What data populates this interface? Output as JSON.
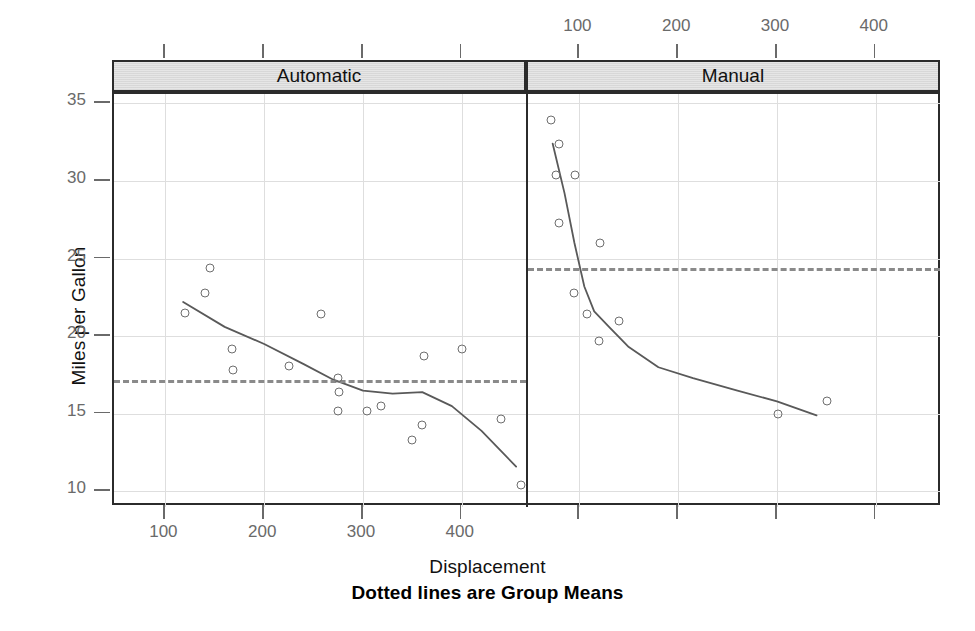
{
  "chart_data": {
    "type": "scatter",
    "title": "",
    "xlabel": "Displacement",
    "ylabel": "Miles per Gallon",
    "caption": "Dotted lines are Group Means",
    "xlim": [
      48,
      465
    ],
    "ylim": [
      9.0,
      35.6
    ],
    "xticks": [
      100,
      200,
      300,
      400
    ],
    "yticks": [
      10,
      15,
      20,
      25,
      30,
      35
    ],
    "grid": true,
    "legend": "none",
    "panel_variable": "Transmission",
    "panels": [
      {
        "label": "Automatic",
        "axis_position": "bottom",
        "mean": 17.15,
        "mean_line_style": "dashed",
        "points": [
          {
            "x": 120,
            "y": 21.5
          },
          {
            "x": 145,
            "y": 24.4
          },
          {
            "x": 140,
            "y": 22.8
          },
          {
            "x": 167,
            "y": 19.2
          },
          {
            "x": 168,
            "y": 17.8
          },
          {
            "x": 225,
            "y": 18.1
          },
          {
            "x": 258,
            "y": 21.4
          },
          {
            "x": 275,
            "y": 17.3
          },
          {
            "x": 276,
            "y": 16.4
          },
          {
            "x": 275,
            "y": 15.2
          },
          {
            "x": 304,
            "y": 15.2
          },
          {
            "x": 318,
            "y": 15.5
          },
          {
            "x": 350,
            "y": 13.3
          },
          {
            "x": 360,
            "y": 14.3
          },
          {
            "x": 362,
            "y": 18.7
          },
          {
            "x": 400,
            "y": 19.2
          },
          {
            "x": 440,
            "y": 14.7
          },
          {
            "x": 460,
            "y": 10.4
          },
          {
            "x": 472,
            "y": 10.4
          }
        ],
        "smooth_curve": [
          {
            "x": 118,
            "y": 22.2
          },
          {
            "x": 160,
            "y": 20.6
          },
          {
            "x": 200,
            "y": 19.5
          },
          {
            "x": 240,
            "y": 18.2
          },
          {
            "x": 270,
            "y": 17.2
          },
          {
            "x": 300,
            "y": 16.5
          },
          {
            "x": 330,
            "y": 16.3
          },
          {
            "x": 360,
            "y": 16.4
          },
          {
            "x": 390,
            "y": 15.5
          },
          {
            "x": 420,
            "y": 13.9
          },
          {
            "x": 455,
            "y": 11.6
          }
        ]
      },
      {
        "label": "Manual",
        "axis_position": "top",
        "mean": 24.4,
        "mean_line_style": "dashed",
        "points": [
          {
            "x": 71,
            "y": 33.9
          },
          {
            "x": 79,
            "y": 32.4
          },
          {
            "x": 76,
            "y": 30.4
          },
          {
            "x": 96,
            "y": 30.4
          },
          {
            "x": 79,
            "y": 27.3
          },
          {
            "x": 121,
            "y": 26.0
          },
          {
            "x": 95,
            "y": 22.8
          },
          {
            "x": 108,
            "y": 21.4
          },
          {
            "x": 140,
            "y": 21.0
          },
          {
            "x": 120,
            "y": 19.7
          },
          {
            "x": 301,
            "y": 15.0
          },
          {
            "x": 351,
            "y": 15.8
          }
        ],
        "smooth_curve": [
          {
            "x": 73,
            "y": 32.4
          },
          {
            "x": 85,
            "y": 29.2
          },
          {
            "x": 95,
            "y": 26.0
          },
          {
            "x": 105,
            "y": 23.2
          },
          {
            "x": 115,
            "y": 21.6
          },
          {
            "x": 130,
            "y": 20.6
          },
          {
            "x": 150,
            "y": 19.3
          },
          {
            "x": 180,
            "y": 18.0
          },
          {
            "x": 215,
            "y": 17.3
          },
          {
            "x": 260,
            "y": 16.5
          },
          {
            "x": 300,
            "y": 15.8
          },
          {
            "x": 340,
            "y": 14.9
          }
        ]
      }
    ]
  },
  "axes": {
    "y_title": "Miles per Gallon",
    "x_title": "Displacement",
    "caption": "Dotted lines are Group Means",
    "y_tick_labels": [
      "35",
      "30",
      "25",
      "20",
      "15",
      "10"
    ],
    "x_tick_labels_bottom": [
      "100",
      "200",
      "300",
      "400"
    ],
    "x_tick_labels_top": [
      "100",
      "200",
      "300",
      "400"
    ]
  },
  "strips": {
    "left": "Automatic",
    "right": "Manual"
  },
  "colors": {
    "frame": "#2b2b2b",
    "grid": "#dedede",
    "point_stroke": "#6e6e6e",
    "mean_line": "#8a8a8a",
    "smooth_line": "#595959",
    "strip_fill": "#e6e6e6",
    "tick_text": "#6a6a6a",
    "label_text": "#111111"
  }
}
